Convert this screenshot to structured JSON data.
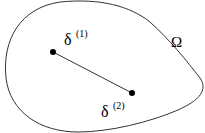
{
  "diagram": {
    "region_label": "Ω",
    "points": [
      {
        "symbol": "δ",
        "superscript": "(1)"
      },
      {
        "symbol": "δ",
        "superscript": "(2)"
      }
    ],
    "colors": {
      "stroke": "#333333",
      "point": "#000000",
      "background": "#ffffff"
    }
  }
}
